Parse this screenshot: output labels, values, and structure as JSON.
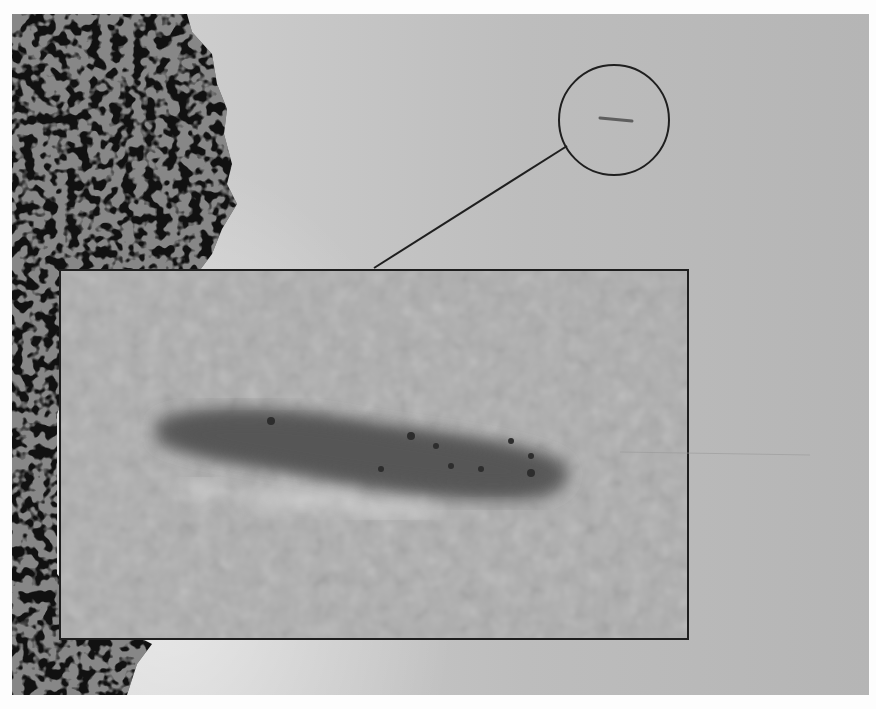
{
  "image": {
    "description": "Grayscale photograph of sky with tree foliage on left edge; a small elongated dark object in the sky is circled and shown magnified in a rectangular inset",
    "colors": {
      "sky_light": "#d6d6d6",
      "sky_dark": "#b5b5b5",
      "foliage": "#111111",
      "inset_bg": "#a9a9a9",
      "object": "#5a5a5a",
      "outline": "#1f1f1f"
    },
    "callout": {
      "circle": {
        "cx": 614,
        "cy": 120,
        "r": 55
      },
      "connector": {
        "x1": 374,
        "y1": 268,
        "x2": 545,
        "y2": 158
      },
      "inset": {
        "x": 59,
        "y": 269,
        "w": 630,
        "h": 371
      }
    }
  }
}
